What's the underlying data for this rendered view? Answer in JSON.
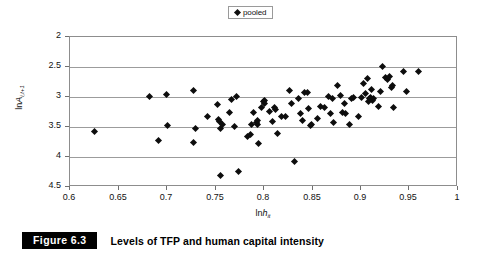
{
  "figure": {
    "number_label": "Figure 6.3",
    "caption": "Levels of TFP and human capital intensity"
  },
  "legend": {
    "position": "top-center",
    "entries": [
      {
        "label": "pooled",
        "marker": "diamond",
        "color": "#0d0d0d"
      }
    ]
  },
  "axes": {
    "x_title_prefix": "ln",
    "x_title_var": "h",
    "x_title_sub": "it",
    "y_title_prefix": "ln",
    "y_title_var": "A",
    "y_title_sub": "i,t+1",
    "x_ticks": [
      "0.6",
      "0.65",
      "0.7",
      "0.75",
      "0.8",
      "0.85",
      "0.9",
      "0.95",
      "1"
    ],
    "y_ticks": [
      "4.5",
      "4",
      "3.5",
      "3",
      "2.5",
      "2"
    ]
  },
  "chart_data": {
    "type": "scatter",
    "title": "Levels of TFP and human capital intensity",
    "xlabel": "lnh_it",
    "ylabel": "lnA_i,t+1",
    "xlim": [
      0.6,
      1.0
    ],
    "ylim": [
      2.0,
      4.5
    ],
    "xticks": [
      0.6,
      0.65,
      0.7,
      0.75,
      0.8,
      0.85,
      0.9,
      0.95,
      1.0
    ],
    "yticks": [
      2.0,
      2.5,
      3.0,
      3.5,
      4.0,
      4.5
    ],
    "grid": "horizontal",
    "legend": [
      "pooled"
    ],
    "marker": "diamond",
    "marker_color": "#0d0d0d",
    "series": [
      {
        "name": "pooled",
        "points": [
          [
            0.625,
            2.93
          ],
          [
            0.682,
            3.51
          ],
          [
            0.691,
            2.78
          ],
          [
            0.699,
            3.55
          ],
          [
            0.7,
            3.03
          ],
          [
            0.727,
            3.61
          ],
          [
            0.727,
            2.74
          ],
          [
            0.729,
            2.98
          ],
          [
            0.742,
            3.17
          ],
          [
            0.752,
            3.38
          ],
          [
            0.753,
            3.12
          ],
          [
            0.754,
            3.09
          ],
          [
            0.755,
            2.98
          ],
          [
            0.755,
            2.2
          ],
          [
            0.757,
            3.04
          ],
          [
            0.764,
            3.25
          ],
          [
            0.767,
            3.46
          ],
          [
            0.77,
            3.01
          ],
          [
            0.772,
            3.51
          ],
          [
            0.774,
            2.26
          ],
          [
            0.783,
            2.84
          ],
          [
            0.786,
            2.87
          ],
          [
            0.787,
            3.05
          ],
          [
            0.789,
            3.24
          ],
          [
            0.792,
            3.08
          ],
          [
            0.793,
            3.05
          ],
          [
            0.793,
            3.11
          ],
          [
            0.794,
            2.73
          ],
          [
            0.797,
            3.33
          ],
          [
            0.799,
            3.43
          ],
          [
            0.8,
            3.45
          ],
          [
            0.801,
            3.39
          ],
          [
            0.806,
            3.26
          ],
          [
            0.809,
            3.1
          ],
          [
            0.811,
            3.32
          ],
          [
            0.812,
            3.3
          ],
          [
            0.814,
            2.9
          ],
          [
            0.818,
            3.18
          ],
          [
            0.822,
            3.17
          ],
          [
            0.826,
            3.61
          ],
          [
            0.828,
            3.4
          ],
          [
            0.831,
            2.43
          ],
          [
            0.836,
            3.47
          ],
          [
            0.838,
            3.23
          ],
          [
            0.84,
            3.11
          ],
          [
            0.842,
            3.57
          ],
          [
            0.845,
            3.58
          ],
          [
            0.846,
            3.31
          ],
          [
            0.848,
            3.02
          ],
          [
            0.849,
            3.04
          ],
          [
            0.855,
            3.14
          ],
          [
            0.858,
            3.34
          ],
          [
            0.862,
            3.33
          ],
          [
            0.866,
            3.51
          ],
          [
            0.869,
            3.22
          ],
          [
            0.871,
            3.47
          ],
          [
            0.872,
            3.08
          ],
          [
            0.876,
            3.7
          ],
          [
            0.879,
            3.53
          ],
          [
            0.881,
            3.25
          ],
          [
            0.883,
            3.4
          ],
          [
            0.884,
            3.23
          ],
          [
            0.888,
            3.05
          ],
          [
            0.89,
            3.48
          ],
          [
            0.892,
            3.49
          ],
          [
            0.897,
            3.18
          ],
          [
            0.9,
            3.49
          ],
          [
            0.903,
            3.73
          ],
          [
            0.905,
            3.56
          ],
          [
            0.907,
            3.81
          ],
          [
            0.908,
            3.43
          ],
          [
            0.909,
            3.47
          ],
          [
            0.91,
            3.5
          ],
          [
            0.911,
            3.62
          ],
          [
            0.912,
            3.45
          ],
          [
            0.913,
            3.48
          ],
          [
            0.918,
            3.34
          ],
          [
            0.92,
            3.59
          ],
          [
            0.922,
            4.01
          ],
          [
            0.925,
            3.83
          ],
          [
            0.927,
            3.8
          ],
          [
            0.929,
            3.85
          ],
          [
            0.931,
            3.66
          ],
          [
            0.932,
            3.69
          ],
          [
            0.933,
            3.33
          ],
          [
            0.944,
            3.92
          ],
          [
            0.947,
            3.59
          ],
          [
            0.959,
            3.93
          ]
        ]
      }
    ]
  }
}
